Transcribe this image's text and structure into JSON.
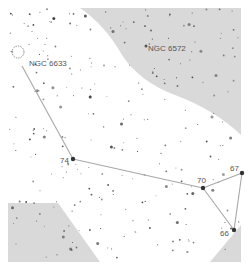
{
  "map": {
    "type": "star-chart",
    "colors": {
      "background": "#ffffff",
      "outside_region": "#d9d9d9",
      "star": "#333333",
      "line": "#a8a8a8",
      "label": "#555555"
    },
    "objects": [
      {
        "id": "ngc6633",
        "label": "NGC 6633",
        "kind": "open-cluster",
        "x": 18,
        "y": 52,
        "label_x": 29,
        "label_y": 66
      },
      {
        "id": "ngc6572",
        "label": "NGC 6572",
        "kind": "planetary-nebula",
        "x": 146,
        "y": 46,
        "label_x": 148,
        "label_y": 51
      }
    ],
    "stars": [
      {
        "id": "s74",
        "label": "74",
        "x": 73,
        "y": 159,
        "r": 2.2,
        "label_x": 60,
        "label_y": 163
      },
      {
        "id": "s70",
        "label": "70",
        "x": 203,
        "y": 188,
        "r": 2.2,
        "label_x": 197,
        "label_y": 183
      },
      {
        "id": "s67",
        "label": "67",
        "x": 242,
        "y": 173,
        "r": 2.2,
        "label_x": 230,
        "label_y": 171
      },
      {
        "id": "s66",
        "label": "66",
        "x": 234,
        "y": 230,
        "r": 2.2,
        "label_x": 220,
        "label_y": 236
      }
    ],
    "asterism_lines": [
      [
        22,
        66,
        73,
        159
      ],
      [
        73,
        159,
        203,
        188
      ],
      [
        203,
        188,
        242,
        173
      ],
      [
        242,
        173,
        234,
        230
      ],
      [
        234,
        230,
        203,
        188
      ]
    ]
  }
}
